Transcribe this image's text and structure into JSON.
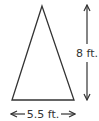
{
  "diagram": {
    "shape": "isosceles-triangle",
    "height_label": "8 ft.",
    "base_label": "5.5 ft.",
    "stroke_color": "#333333",
    "fill_color": "#ffffff"
  }
}
